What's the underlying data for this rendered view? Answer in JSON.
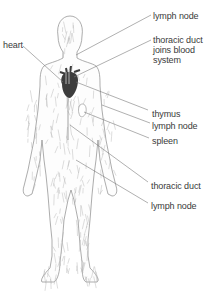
{
  "diagram": {
    "colors": {
      "heart": "#3c3c3c",
      "outline": "#8a8a8a",
      "vessels": "#b4b4b4",
      "leader": "#7a7a7a",
      "text": "#3a3a3a"
    },
    "labels": [
      {
        "id": "lymph-node-neck",
        "text": "lymph node",
        "side": "right"
      },
      {
        "id": "thoracic-duct-joins",
        "lines": [
          "thoracic duct",
          "joins blood",
          "system"
        ],
        "side": "right"
      },
      {
        "id": "heart",
        "text": "heart",
        "side": "left"
      },
      {
        "id": "thymus",
        "text": "thymus",
        "side": "right"
      },
      {
        "id": "lymph-node-armpit",
        "text": "lymph node",
        "side": "right"
      },
      {
        "id": "spleen",
        "text": "spleen",
        "side": "right"
      },
      {
        "id": "thoracic-duct",
        "text": "thoracic duct",
        "side": "right"
      },
      {
        "id": "lymph-node-groin",
        "text": "lymph node",
        "side": "right"
      }
    ]
  }
}
